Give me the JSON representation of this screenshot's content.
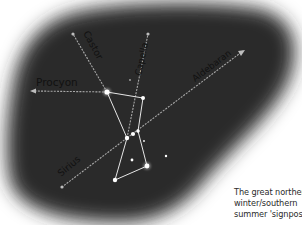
{
  "figure": {
    "background_color": "#2a2a2a",
    "star_color": "#ffffff",
    "line_color": "#d8d8d8",
    "label_color": "#111111"
  },
  "pointers": [
    {
      "label": "Procyon",
      "direction": "left"
    },
    {
      "label": "Castor",
      "direction": "up-left"
    },
    {
      "label": "Capella",
      "direction": "up"
    },
    {
      "label": "Aldebaran",
      "direction": "up-right"
    },
    {
      "label": "Sirius",
      "direction": "down-left"
    }
  ],
  "caption": {
    "line1": "The great northern",
    "line2": "winter/southern",
    "line3": "summer 'signpost'"
  }
}
